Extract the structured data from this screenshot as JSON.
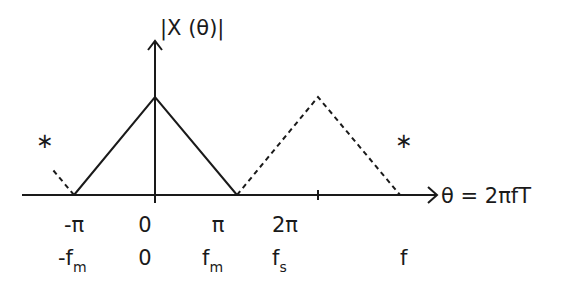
{
  "diagram": {
    "y_axis_label": "|X (θ)|",
    "x_axis_label": "θ = 2πfT",
    "theta_ticks": [
      "-π",
      "0",
      "π",
      "2π"
    ],
    "freq_ticks": [
      {
        "base": "-f",
        "sub": "m"
      },
      {
        "base": "0",
        "sub": ""
      },
      {
        "base": "f",
        "sub": "m"
      },
      {
        "base": "f",
        "sub": "s"
      }
    ],
    "freq_axis_label": "f",
    "marker_left": "∗",
    "marker_right": "∗",
    "line_color": "#1a1a1a"
  }
}
